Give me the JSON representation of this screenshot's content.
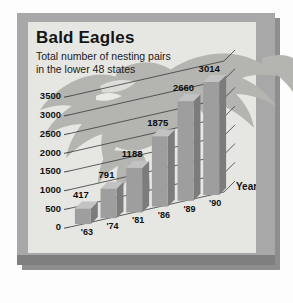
{
  "chart_data": {
    "type": "bar",
    "title": "Bald Eagles",
    "subtitle_line1": "Total number of nesting pairs",
    "subtitle_line2": "in the lower 48 states",
    "xlabel": "Year",
    "ylabel": "",
    "categories": [
      "'63",
      "'74",
      "'81",
      "'86",
      "'89",
      "'90"
    ],
    "values": [
      417,
      791,
      1188,
      1875,
      2660,
      3014
    ],
    "data_labels": [
      "417",
      "791",
      "1188",
      "1875",
      "2660",
      "3014"
    ],
    "ylim": [
      0,
      3500
    ],
    "ytick_labels": [
      "0",
      "500",
      "1000",
      "1500",
      "2000",
      "2500",
      "3000",
      "3500"
    ],
    "ytick_values": [
      0,
      500,
      1000,
      1500,
      2000,
      2500,
      3000,
      3500
    ],
    "grid": true,
    "legend": "none",
    "style": "3d-bars-with-eagle-watermark",
    "colors": {
      "bar_front": "#9e9e9e",
      "bar_side": "#7c7c7c",
      "bar_top": "#c2c2c2",
      "panel_background": "#e6e6e3",
      "frame": "#a8a8a8",
      "frame_shadow": "#8e8e8e",
      "gridline": "#3a3a3a",
      "text": "#121212",
      "watermark": "#b4b4b0"
    }
  }
}
